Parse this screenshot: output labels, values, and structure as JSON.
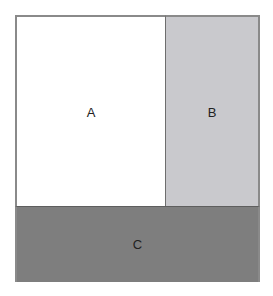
{
  "diagram": {
    "regions": [
      {
        "id": "A",
        "label": "A",
        "fill": "#ffffff"
      },
      {
        "id": "B",
        "label": "B",
        "fill": "#c9c9cd"
      },
      {
        "id": "C",
        "label": "C",
        "fill": "#7e7e7e"
      }
    ]
  }
}
